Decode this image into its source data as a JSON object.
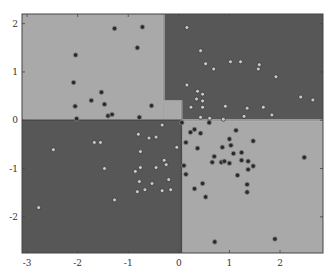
{
  "chart_data": {
    "type": "scatter",
    "title": "",
    "xlabel": "",
    "ylabel": "",
    "xlim": [
      -3.1,
      2.85
    ],
    "ylim": [
      -2.75,
      2.2
    ],
    "grid": false,
    "legend": null,
    "x_ticks": [
      "-3",
      "-2",
      "-1",
      "0",
      "1",
      "2"
    ],
    "y_ticks": [
      "2",
      "1",
      "0",
      "-1",
      "-2"
    ],
    "colors": {
      "region_light": "#a9a9a9",
      "region_dark": "#575757",
      "point_class_a": "#2a2a2a",
      "point_class_b": "#c8c8c8",
      "boundary": "#bdbdbd"
    },
    "regions": [
      {
        "name": "top-left",
        "class": "light",
        "x": [
          -3.1,
          -0.3
        ],
        "y": [
          0,
          2.2
        ]
      },
      {
        "name": "top-right",
        "class": "dark",
        "x": [
          -0.3,
          2.85
        ],
        "y": [
          0,
          2.2
        ],
        "notch": {
          "x": [
            -0.3,
            0.05
          ],
          "y": [
            0,
            0.4
          ]
        }
      },
      {
        "name": "bottom-left",
        "class": "dark",
        "x": [
          -3.1,
          0.05
        ],
        "y": [
          -2.75,
          0
        ]
      },
      {
        "name": "bottom-right",
        "class": "light",
        "x": [
          0.05,
          2.85
        ],
        "y": [
          -2.75,
          0
        ]
      }
    ],
    "series": [
      {
        "name": "class A (dark markers)",
        "points": [
          [
            -1.27,
            1.9
          ],
          [
            -0.72,
            1.93
          ],
          [
            -0.82,
            1.5
          ],
          [
            -2.04,
            1.35
          ],
          [
            -2.08,
            0.78
          ],
          [
            -1.53,
            0.58
          ],
          [
            -1.73,
            0.41
          ],
          [
            -1.47,
            0.33
          ],
          [
            -2.05,
            0.29
          ],
          [
            -1.4,
            0.09
          ],
          [
            -1.32,
            0.12
          ],
          [
            -2.02,
            0.03
          ],
          [
            -0.78,
            0.06
          ],
          [
            -0.54,
            0.3
          ],
          [
            0.06,
            -0.05
          ],
          [
            0.6,
            -0.05
          ],
          [
            0.23,
            -0.25
          ],
          [
            0.31,
            -0.19
          ],
          [
            0.43,
            -0.27
          ],
          [
            1.13,
            -0.21
          ],
          [
            0.14,
            -0.46
          ],
          [
            0.37,
            -0.58
          ],
          [
            1.0,
            -0.39
          ],
          [
            1.03,
            -0.52
          ],
          [
            0.86,
            -0.56
          ],
          [
            1.47,
            -0.43
          ],
          [
            1.24,
            -0.67
          ],
          [
            1.24,
            -0.83
          ],
          [
            1.08,
            -0.69
          ],
          [
            0.7,
            -0.75
          ],
          [
            0.66,
            -0.87
          ],
          [
            0.84,
            -0.87
          ],
          [
            0.9,
            -0.85
          ],
          [
            1.0,
            -0.89
          ],
          [
            1.37,
            -0.85
          ],
          [
            1.47,
            -0.95
          ],
          [
            1.37,
            -1.02
          ],
          [
            1.16,
            -1.14
          ],
          [
            0.1,
            -0.94
          ],
          [
            0.14,
            -1.12
          ],
          [
            0.47,
            -1.31
          ],
          [
            1.35,
            -1.33
          ],
          [
            1.35,
            -1.49
          ],
          [
            0.31,
            -1.42
          ],
          [
            0.53,
            -1.59
          ],
          [
            0.71,
            -2.52
          ],
          [
            1.9,
            -2.46
          ],
          [
            2.48,
            -0.77
          ]
        ]
      },
      {
        "name": "class B (light markers)",
        "points": [
          [
            0.16,
            1.92
          ],
          [
            0.43,
            1.44
          ],
          [
            0.53,
            1.17
          ],
          [
            0.69,
            1.06
          ],
          [
            1.02,
            1.21
          ],
          [
            1.22,
            1.21
          ],
          [
            1.59,
            1.15
          ],
          [
            1.57,
            1.06
          ],
          [
            1.92,
            0.9
          ],
          [
            0.16,
            0.73
          ],
          [
            0.37,
            0.6
          ],
          [
            0.47,
            0.54
          ],
          [
            0.47,
            0.4
          ],
          [
            0.35,
            0.44
          ],
          [
            0.24,
            0.27
          ],
          [
            0.47,
            0.27
          ],
          [
            0.92,
            0.29
          ],
          [
            1.35,
            0.25
          ],
          [
            1.29,
            0.08
          ],
          [
            1.67,
            0.27
          ],
          [
            1.84,
            0.11
          ],
          [
            2.41,
            0.48
          ],
          [
            2.65,
            0.42
          ],
          [
            0.43,
            0.06
          ],
          [
            0.61,
            0.04
          ],
          [
            0.88,
            0.02
          ],
          [
            -2.48,
            -0.61
          ],
          [
            -1.67,
            -0.46
          ],
          [
            -1.55,
            -0.46
          ],
          [
            -1.47,
            -1.0
          ],
          [
            -0.8,
            -0.29
          ],
          [
            -0.59,
            -0.37
          ],
          [
            -0.45,
            -0.35
          ],
          [
            -0.33,
            -0.1
          ],
          [
            -0.76,
            -0.65
          ],
          [
            -0.04,
            -0.56
          ],
          [
            -0.29,
            -0.83
          ],
          [
            -0.25,
            -0.92
          ],
          [
            -0.76,
            -0.98
          ],
          [
            -0.45,
            -0.98
          ],
          [
            -0.86,
            -1.06
          ],
          [
            -0.78,
            -1.27
          ],
          [
            -0.2,
            -1.23
          ],
          [
            -0.82,
            -1.48
          ],
          [
            -0.67,
            -1.44
          ],
          [
            -0.53,
            -1.31
          ],
          [
            -0.33,
            -1.46
          ],
          [
            -0.16,
            -1.44
          ],
          [
            -1.27,
            -1.65
          ],
          [
            -2.77,
            -1.81
          ]
        ]
      }
    ]
  }
}
